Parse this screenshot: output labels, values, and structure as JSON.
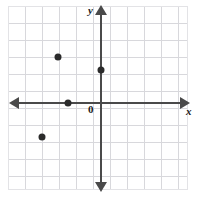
{
  "figure": {
    "type": "coordinate-plane",
    "background_color": "#ffffff",
    "grid_color": "#d8d8dc",
    "axis_color": "#4a4a4a",
    "point_color": "#2b2b2b"
  },
  "labels": {
    "y_axis": "y",
    "x_axis": "x",
    "origin": "0"
  },
  "chart_data": {
    "type": "scatter",
    "title": "",
    "xlabel": "x",
    "ylabel": "y",
    "origin_label": "0",
    "grid": true,
    "legend": "none",
    "xlim": [
      -5.5,
      5
    ],
    "ylim": [
      -5.5,
      5.5
    ],
    "x_tick_step": 1,
    "y_tick_step": 1,
    "tick_labels_shown": false,
    "points": [
      {
        "x": -2.5,
        "y": 2.7,
        "px": 58,
        "py": 57
      },
      {
        "x": 0,
        "y": 2,
        "px": 101,
        "py": 70
      },
      {
        "x": -2,
        "y": 0,
        "px": 68,
        "py": 103
      },
      {
        "x": -3.5,
        "y": -2,
        "px": 42,
        "py": 137
      }
    ]
  }
}
